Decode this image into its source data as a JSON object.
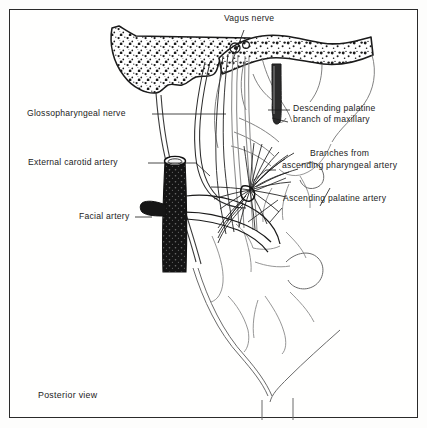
{
  "figure": {
    "caption": "Posterior view",
    "view": "Posterior view",
    "style": "pen-and-ink anatomical line drawing",
    "background_color": "#fdfdfc",
    "ink_color": "#1b1b1b",
    "frame_color": "#2a2a2a"
  },
  "labels": {
    "vagus_nerve": "Vagus nerve",
    "glossopharyngeal_nerve": "Glossopharyngeal nerve",
    "external_carotid_artery": "External carotid artery",
    "facial_artery": "Facial artery",
    "descending_palatine_line1": "Descending palatine",
    "descending_palatine_line2": "branch of maxillary",
    "branches_line1": "Branches from",
    "branches_line2": "ascending pharyngeal artery",
    "ascending_palatine_artery": "Ascending palatine artery"
  },
  "structures": [
    {
      "name": "pterygoid-hamulus-bone",
      "description": "stippled hook-shaped bone at upper left"
    },
    {
      "name": "hard-palate-bone",
      "description": "stippled horizontal bony shelf across top"
    },
    {
      "name": "descending-palatine-artery-tube",
      "description": "narrow dark vertical vessel descending from palate"
    },
    {
      "name": "vagus-nerve-strands",
      "description": "pale parallel nerve strands descending from skull base"
    },
    {
      "name": "glossopharyngeal-nerve-strand",
      "description": "fine nerve curving down to pharyngeal wall"
    },
    {
      "name": "external-carotid-artery-trunk",
      "description": "thick black vertical artery with cut elliptical end"
    },
    {
      "name": "facial-artery-branch",
      "description": "short dark branch leaving carotid to the left"
    },
    {
      "name": "ascending-pharyngeal-fan",
      "description": "radiating fan of fine arterial twigs on pharyngeal wall"
    },
    {
      "name": "ascending-palatine-artery-loop",
      "description": "curved looping vessel below the fan"
    },
    {
      "name": "pharyngeal-constrictor-outlines",
      "description": "faint pencil outlines of constrictor muscles"
    },
    {
      "name": "esophagus-outline",
      "description": "narrowing V shaped outline at bottom"
    }
  ]
}
